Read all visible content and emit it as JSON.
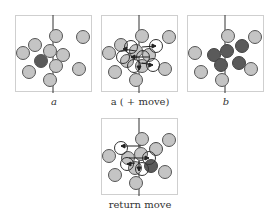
{
  "figure": {
    "panels": [
      {
        "id": "a",
        "caption": "a",
        "caption_italic": true
      },
      {
        "id": "a-move",
        "caption": "a ( + move)",
        "caption_italic": false
      },
      {
        "id": "b",
        "caption": "b",
        "caption_italic": true
      },
      {
        "id": "return-move",
        "caption": "return move",
        "caption_italic": false
      }
    ],
    "colors": {
      "light_particle": "#c4c4c4",
      "dark_particle": "#5a5a5a",
      "outline": "#555555",
      "frame": "#cfcfcf",
      "line": "#333333"
    }
  }
}
